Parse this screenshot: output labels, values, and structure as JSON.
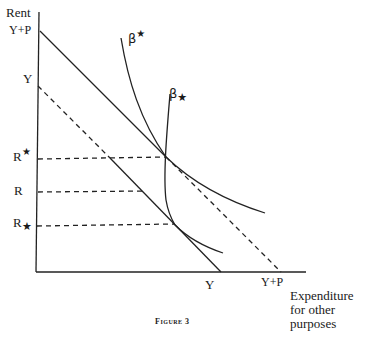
{
  "figure": {
    "caption": "Figure 3",
    "y_axis_label": "Rent",
    "x_axis_label_lines": [
      "Expenditure",
      "for other",
      "purposes"
    ],
    "y_ticks": {
      "y_plus_p": "Y+P",
      "y": "Y",
      "r_upper": "R",
      "r_upper_mark": "★",
      "r": "R",
      "r_lower": "R",
      "r_lower_mark": "★"
    },
    "x_ticks": {
      "y": "Y",
      "y_plus_p": "Y+P"
    },
    "curve_labels": {
      "beta_upper": "β",
      "beta_upper_mark": "★",
      "beta_lower": "β",
      "beta_lower_mark": "★"
    }
  }
}
